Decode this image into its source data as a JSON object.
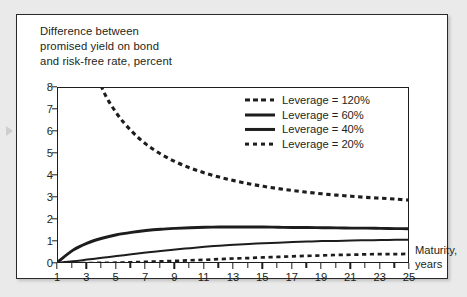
{
  "figure": {
    "title": "Difference between\npromised yield on bond\nand risk-free rate, percent",
    "axis_label": "Maturity,\nyears"
  },
  "legend": {
    "items": [
      {
        "label": "Leverage = 120%",
        "style": "dashed-thick"
      },
      {
        "label": "Leverage = 60%",
        "style": "solid-thick"
      },
      {
        "label": "Leverage = 40%",
        "style": "solid-thin"
      },
      {
        "label": "Leverage = 20%",
        "style": "dashed-thin"
      }
    ]
  },
  "chart_data": {
    "type": "line",
    "title": "Difference between promised yield on bond and risk-free rate, percent",
    "xlabel": "Maturity, years",
    "ylabel": "Difference between promised yield on bond and risk-free rate, percent",
    "xlim": [
      1,
      25
    ],
    "ylim": [
      0,
      8
    ],
    "xticks": [
      1,
      3,
      5,
      7,
      9,
      11,
      13,
      15,
      17,
      19,
      21,
      23,
      25
    ],
    "xminor_ticks": [
      2,
      4,
      6,
      8,
      10,
      12,
      14,
      16,
      18,
      20,
      22,
      24
    ],
    "yticks": [
      0,
      1,
      2,
      3,
      4,
      5,
      6,
      7,
      8
    ],
    "grid": false,
    "legend_position": "upper-right-inside",
    "x": [
      1,
      2,
      3,
      4,
      5,
      6,
      7,
      8,
      9,
      10,
      11,
      12,
      13,
      14,
      15,
      16,
      17,
      18,
      19,
      20,
      21,
      22,
      23,
      24,
      25
    ],
    "series": [
      {
        "name": "Leverage = 120%",
        "style": "dashed-thick",
        "color": "#1d1d1d",
        "note": "Starts above the top of the axis and decays; crosses y=8 near x=4.",
        "values": [
          21.0,
          13.2,
          9.9,
          8.0,
          6.85,
          6.05,
          5.45,
          5.0,
          4.65,
          4.37,
          4.14,
          3.95,
          3.79,
          3.65,
          3.53,
          3.43,
          3.34,
          3.26,
          3.19,
          3.13,
          3.08,
          3.03,
          2.99,
          2.95,
          2.9
        ]
      },
      {
        "name": "Leverage = 60%",
        "style": "solid-thick",
        "color": "#1d1d1d",
        "values": [
          0.1,
          0.62,
          0.95,
          1.17,
          1.33,
          1.44,
          1.52,
          1.58,
          1.62,
          1.65,
          1.67,
          1.68,
          1.68,
          1.68,
          1.68,
          1.67,
          1.66,
          1.66,
          1.65,
          1.64,
          1.63,
          1.63,
          1.62,
          1.61,
          1.6
        ]
      },
      {
        "name": "Leverage = 40%",
        "style": "solid-thin",
        "color": "#1d1d1d",
        "values": [
          0.06,
          0.12,
          0.2,
          0.28,
          0.36,
          0.44,
          0.52,
          0.59,
          0.66,
          0.72,
          0.78,
          0.83,
          0.87,
          0.91,
          0.94,
          0.97,
          1.0,
          1.02,
          1.04,
          1.05,
          1.07,
          1.08,
          1.09,
          1.1,
          1.1
        ]
      },
      {
        "name": "Leverage = 20%",
        "style": "dashed-thin",
        "color": "#1d1d1d",
        "values": [
          0.02,
          0.03,
          0.04,
          0.05,
          0.06,
          0.08,
          0.1,
          0.12,
          0.14,
          0.17,
          0.19,
          0.22,
          0.25,
          0.27,
          0.3,
          0.32,
          0.35,
          0.37,
          0.39,
          0.41,
          0.42,
          0.44,
          0.45,
          0.45,
          0.46
        ]
      }
    ]
  },
  "colors": {
    "ink": "#1d1d1d",
    "panel": "#ffffff",
    "page": "#eaeaea"
  }
}
